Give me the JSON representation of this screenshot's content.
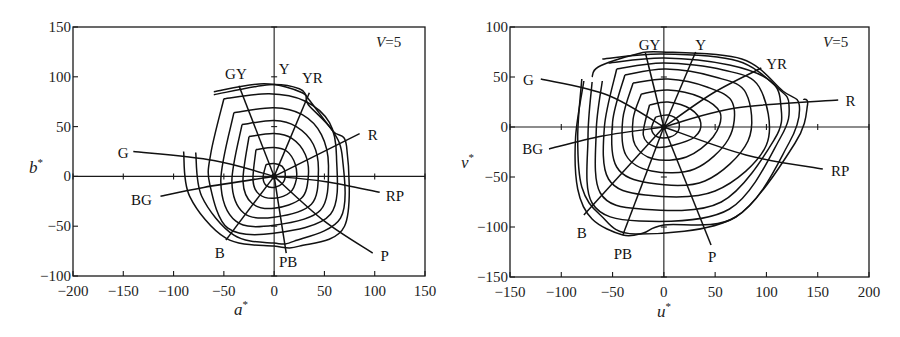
{
  "chart_data": [
    {
      "type": "line",
      "title": "",
      "annotation": "V=5",
      "annotation_italic": "V",
      "annotation_rest": "=5",
      "xlabel": "a*",
      "ylabel": "b*",
      "xlim": [
        -200,
        150
      ],
      "ylim": [
        -100,
        150
      ],
      "xticks": [
        -200,
        -150,
        -100,
        -50,
        0,
        50,
        100,
        150
      ],
      "yticks": [
        -100,
        -50,
        0,
        50,
        100,
        150
      ],
      "xtick_labels": [
        "−200",
        "−150",
        "−100",
        "−50",
        "0",
        "50",
        "100",
        "150"
      ],
      "ytick_labels": [
        "−100",
        "−50",
        "0",
        "50",
        "100",
        "150"
      ],
      "grid": false,
      "description": "Munsell Value 5 constant-chroma contours and hue lines plotted in CIELAB a*b* plane",
      "contours": [
        [
          [
            -8,
            12
          ],
          [
            0,
            13
          ],
          [
            8,
            10
          ],
          [
            11,
            3
          ],
          [
            9,
            -6
          ],
          [
            0,
            -11
          ],
          [
            -8,
            -9
          ],
          [
            -11,
            -1
          ],
          [
            -8,
            12
          ]
        ],
        [
          [
            -18,
            27
          ],
          [
            0,
            29
          ],
          [
            13,
            25
          ],
          [
            21,
            12
          ],
          [
            22,
            -3
          ],
          [
            16,
            -16
          ],
          [
            0,
            -22
          ],
          [
            -15,
            -18
          ],
          [
            -21,
            -4
          ],
          [
            -18,
            27
          ]
        ],
        [
          [
            -25,
            40
          ],
          [
            0,
            43
          ],
          [
            18,
            38
          ],
          [
            31,
            22
          ],
          [
            34,
            0
          ],
          [
            27,
            -22
          ],
          [
            0,
            -32
          ],
          [
            -22,
            -27
          ],
          [
            -31,
            -5
          ],
          [
            -25,
            40
          ]
        ],
        [
          [
            -32,
            52
          ],
          [
            0,
            56
          ],
          [
            22,
            50
          ],
          [
            39,
            32
          ],
          [
            44,
            5
          ],
          [
            37,
            -28
          ],
          [
            0,
            -41
          ],
          [
            -30,
            -37
          ],
          [
            -42,
            -5
          ],
          [
            -32,
            52
          ]
        ],
        [
          [
            -40,
            64
          ],
          [
            0,
            69
          ],
          [
            28,
            62
          ],
          [
            47,
            42
          ],
          [
            54,
            10
          ],
          [
            46,
            -34
          ],
          [
            0,
            -49
          ],
          [
            -38,
            -45
          ],
          [
            -53,
            -5
          ],
          [
            -40,
            64
          ]
        ],
        [
          [
            -50,
            78
          ],
          [
            -5,
            83
          ],
          [
            30,
            76
          ],
          [
            55,
            54
          ],
          [
            62,
            20
          ],
          [
            56,
            -38
          ],
          [
            0,
            -57
          ],
          [
            -46,
            -52
          ],
          [
            -64,
            -8
          ],
          [
            -63,
            23
          ],
          [
            -50,
            78
          ]
        ],
        [
          [
            -60,
            85
          ],
          [
            -10,
            93
          ],
          [
            28,
            84
          ],
          [
            34,
            72
          ],
          [
            58,
            46
          ],
          [
            68,
            18
          ],
          [
            66,
            -42
          ],
          [
            20,
            -65
          ],
          [
            0,
            -67
          ],
          [
            -40,
            -59
          ],
          [
            -72,
            -20
          ],
          [
            -78,
            24
          ]
        ],
        [
          [
            -60,
            82
          ],
          [
            -5,
            92
          ],
          [
            25,
            88
          ],
          [
            34,
            78
          ],
          [
            58,
            46
          ],
          [
            72,
            30
          ],
          [
            70,
            -50
          ],
          [
            25,
            -70
          ],
          [
            0,
            -70
          ],
          [
            -48,
            -62
          ],
          [
            -84,
            -20
          ],
          [
            -90,
            25
          ]
        ]
      ],
      "hue_lines": [
        {
          "name": "Y",
          "label_pos": [
            10,
            108
          ],
          "points": [
            [
              0,
              0
            ],
            [
              0,
              100
            ]
          ],
          "line": false
        },
        {
          "name": "YR",
          "label_pos": [
            38,
            99
          ],
          "points": [
            [
              0,
              0
            ],
            [
              35,
              84
            ]
          ]
        },
        {
          "name": "GY",
          "label_pos": [
            -38,
            103
          ],
          "points": [
            [
              0,
              0
            ],
            [
              -35,
              91
            ]
          ]
        },
        {
          "name": "G",
          "label_pos": [
            -150,
            23
          ],
          "points": [
            [
              0,
              0
            ],
            [
              -60,
              16
            ],
            [
              -140,
              25
            ]
          ]
        },
        {
          "name": "R",
          "label_pos": [
            98,
            42
          ],
          "points": [
            [
              0,
              0
            ],
            [
              85,
              43
            ]
          ]
        },
        {
          "name": "BG",
          "label_pos": [
            -132,
            -24
          ],
          "points": [
            [
              0,
              0
            ],
            [
              -70,
              -11
            ],
            [
              -113,
              -20
            ]
          ]
        },
        {
          "name": "RP",
          "label_pos": [
            120,
            -20
          ],
          "points": [
            [
              0,
              0
            ],
            [
              50,
              -5
            ],
            [
              105,
              -16
            ]
          ]
        },
        {
          "name": "B",
          "label_pos": [
            -54,
            -77
          ],
          "points": [
            [
              0,
              0
            ],
            [
              -48,
              -64
            ]
          ]
        },
        {
          "name": "PB",
          "label_pos": [
            14,
            -86
          ],
          "points": [
            [
              0,
              0
            ],
            [
              12,
              -77
            ]
          ]
        },
        {
          "name": "P",
          "label_pos": [
            110,
            -80
          ],
          "points": [
            [
              0,
              0
            ],
            [
              50,
              -45
            ],
            [
              98,
              -77
            ]
          ]
        }
      ]
    },
    {
      "type": "line",
      "title": "",
      "annotation": "V=5",
      "annotation_italic": "V",
      "annotation_rest": "=5",
      "xlabel": "u*",
      "ylabel": "v*",
      "xlim": [
        -150,
        200
      ],
      "ylim": [
        -150,
        100
      ],
      "xticks": [
        -150,
        -100,
        -50,
        0,
        50,
        100,
        150,
        200
      ],
      "yticks": [
        -150,
        -100,
        -50,
        0,
        50,
        100
      ],
      "xtick_labels": [
        "−150",
        "−100",
        "−50",
        "0",
        "50",
        "100",
        "150",
        "200"
      ],
      "ytick_labels": [
        "−150",
        "−100",
        "−50",
        "0",
        "50",
        "100"
      ],
      "grid": false,
      "description": "Munsell Value 5 constant-chroma contours and hue lines plotted in CIELUV u*v* plane",
      "contours": [
        [
          [
            -8,
            10
          ],
          [
            4,
            12
          ],
          [
            14,
            6
          ],
          [
            14,
            -4
          ],
          [
            6,
            -10
          ],
          [
            -6,
            -10
          ],
          [
            -12,
            -2
          ],
          [
            -8,
            10
          ]
        ],
        [
          [
            -14,
            22
          ],
          [
            4,
            25
          ],
          [
            26,
            18
          ],
          [
            36,
            4
          ],
          [
            30,
            -10
          ],
          [
            10,
            -18
          ],
          [
            -8,
            -20
          ],
          [
            -20,
            -8
          ],
          [
            -14,
            22
          ]
        ],
        [
          [
            -22,
            33
          ],
          [
            4,
            37
          ],
          [
            35,
            30
          ],
          [
            55,
            14
          ],
          [
            48,
            -10
          ],
          [
            22,
            -30
          ],
          [
            -10,
            -32
          ],
          [
            -28,
            -18
          ],
          [
            -30,
            8
          ],
          [
            -22,
            33
          ]
        ],
        [
          [
            -30,
            44
          ],
          [
            4,
            48
          ],
          [
            42,
            40
          ],
          [
            67,
            24
          ],
          [
            63,
            -12
          ],
          [
            30,
            -42
          ],
          [
            -12,
            -44
          ],
          [
            -37,
            -28
          ],
          [
            -40,
            8
          ],
          [
            -30,
            44
          ]
        ],
        [
          [
            -38,
            52
          ],
          [
            2,
            58
          ],
          [
            50,
            50
          ],
          [
            80,
            34
          ],
          [
            82,
            -14
          ],
          [
            40,
            -54
          ],
          [
            -14,
            -56
          ],
          [
            -46,
            -40
          ],
          [
            -50,
            5
          ],
          [
            -38,
            52
          ]
        ],
        [
          [
            -46,
            58
          ],
          [
            0,
            64
          ],
          [
            58,
            57
          ],
          [
            93,
            40
          ],
          [
            100,
            -18
          ],
          [
            50,
            -64
          ],
          [
            -18,
            -68
          ],
          [
            -54,
            -52
          ],
          [
            -58,
            0
          ],
          [
            -46,
            58
          ]
        ],
        [
          [
            -54,
            64
          ],
          [
            0,
            69
          ],
          [
            64,
            62
          ],
          [
            104,
            46
          ],
          [
            114,
            22
          ],
          [
            108,
            -12
          ],
          [
            56,
            -75
          ],
          [
            -22,
            -82
          ],
          [
            -62,
            -66
          ],
          [
            -66,
            -5
          ],
          [
            -60,
            46
          ]
        ],
        [
          [
            -60,
            68
          ],
          [
            -2,
            73
          ],
          [
            72,
            66
          ],
          [
            112,
            38
          ],
          [
            122,
            22
          ],
          [
            114,
            -10
          ],
          [
            64,
            -82
          ],
          [
            -24,
            -94
          ],
          [
            -70,
            -76
          ],
          [
            -74,
            -10
          ],
          [
            -70,
            45
          ]
        ],
        [
          [
            -70,
            50
          ],
          [
            -64,
            60
          ],
          [
            -30,
            72
          ],
          [
            -2,
            75
          ],
          [
            76,
            68
          ],
          [
            116,
            36
          ],
          [
            132,
            22
          ],
          [
            122,
            -16
          ],
          [
            70,
            -90
          ],
          [
            -28,
            -107
          ],
          [
            -62,
            -88
          ],
          [
            -80,
            -60
          ],
          [
            -84,
            -10
          ],
          [
            -80,
            48
          ]
        ],
        [
          [
            -78,
            46
          ],
          [
            -86,
            -10
          ],
          [
            -84,
            -62
          ],
          [
            -70,
            -92
          ],
          [
            -40,
            -108
          ],
          [
            -20,
            -106
          ],
          [
            0,
            -98
          ],
          [
            70,
            -90
          ],
          [
            128,
            -16
          ],
          [
            140,
            22
          ],
          [
            136,
            28
          ]
        ]
      ],
      "hue_lines": [
        {
          "name": "GY",
          "label_pos": [
            -14,
            82
          ],
          "points": [
            [
              0,
              0
            ],
            [
              -18,
              74
            ]
          ]
        },
        {
          "name": "Y",
          "label_pos": [
            36,
            82
          ],
          "points": [
            [
              0,
              0
            ],
            [
              31,
              75
            ]
          ]
        },
        {
          "name": "YR",
          "label_pos": [
            110,
            63
          ],
          "points": [
            [
              0,
              0
            ],
            [
              48,
              34
            ],
            [
              95,
              59
            ]
          ]
        },
        {
          "name": "G",
          "label_pos": [
            -132,
            47
          ],
          "points": [
            [
              0,
              0
            ],
            [
              -55,
              32
            ],
            [
              -120,
              48
            ]
          ]
        },
        {
          "name": "R",
          "label_pos": [
            182,
            26
          ],
          "points": [
            [
              0,
              0
            ],
            [
              70,
              19
            ],
            [
              170,
              27
            ]
          ]
        },
        {
          "name": "BG",
          "label_pos": [
            -128,
            -22
          ],
          "points": [
            [
              0,
              0
            ],
            [
              -60,
              -9
            ],
            [
              -112,
              -22
            ]
          ]
        },
        {
          "name": "RP",
          "label_pos": [
            172,
            -44
          ],
          "points": [
            [
              0,
              0
            ],
            [
              80,
              -28
            ],
            [
              155,
              -42
            ]
          ]
        },
        {
          "name": "B",
          "label_pos": [
            -80,
            -106
          ],
          "points": [
            [
              0,
              0
            ],
            [
              -78,
              -88
            ]
          ]
        },
        {
          "name": "PB",
          "label_pos": [
            -40,
            -127
          ],
          "points": [
            [
              0,
              0
            ],
            [
              -40,
              -108
            ]
          ]
        },
        {
          "name": "P",
          "label_pos": [
            47,
            -130
          ],
          "points": [
            [
              0,
              0
            ],
            [
              46,
              -118
            ]
          ]
        }
      ]
    }
  ],
  "charts": [
    {
      "annotation_italic": "V",
      "annotation_rest": "=5",
      "xlabel": "a",
      "ylabel": "b"
    },
    {
      "annotation_italic": "V",
      "annotation_rest": "=5",
      "xlabel": "u",
      "ylabel": "v"
    }
  ]
}
